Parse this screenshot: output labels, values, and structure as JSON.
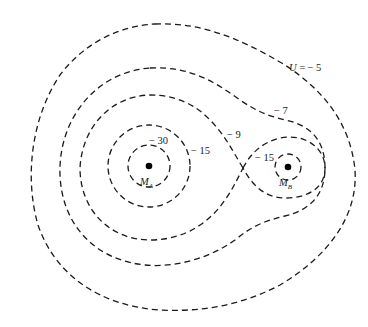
{
  "diagram": {
    "type": "equipotential contour map",
    "masses": [
      {
        "id": "A",
        "label": "M",
        "subscript": "A"
      },
      {
        "id": "B",
        "label": "M",
        "subscript": "B"
      }
    ],
    "contours": [
      {
        "value": "U = − 5",
        "label_var": "U",
        "label_eq": "=",
        "label_num": "− 5"
      },
      {
        "value": "−7",
        "label": "− 7"
      },
      {
        "value": "−9",
        "label": "− 9"
      },
      {
        "value": "−15 (around M_A)",
        "label": "− 15"
      },
      {
        "value": "−15 (around M_B)",
        "label": "− 15"
      },
      {
        "value": "−30",
        "label": "− 30"
      }
    ],
    "colors": {
      "line": "#1a1a1a",
      "mass": "#000000",
      "background": "#ffffff"
    }
  }
}
